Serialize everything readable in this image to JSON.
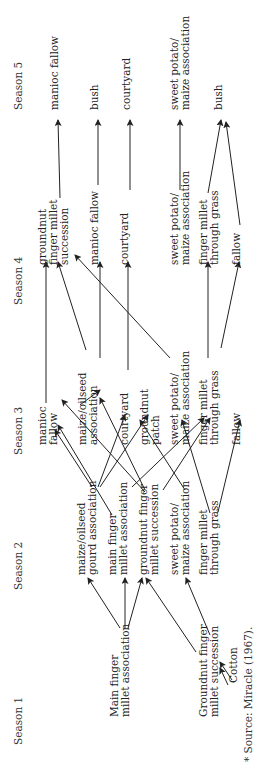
{
  "seasons": [
    {
      "label": "Season 1",
      "x": 22,
      "y": 745
    },
    {
      "label": "Season 2",
      "x": 22,
      "y": 590
    },
    {
      "label": "Season 3",
      "x": 22,
      "y": 455
    },
    {
      "label": "Season 4",
      "x": 22,
      "y": 305
    },
    {
      "label": "Season 5",
      "x": 22,
      "y": 110
    }
  ],
  "nodes": [
    {
      "id": "s1_main",
      "lines": [
        "Main finger",
        "millet association"
      ],
      "x": 118,
      "y": 717
    },
    {
      "id": "s1_gnut",
      "lines": [
        "Groundnut finger",
        "millet succession"
      ],
      "x": 207,
      "y": 717
    },
    {
      "id": "s1_cotton",
      "lines": [
        "Cotton"
      ],
      "x": 237,
      "y": 683
    },
    {
      "id": "s2_maize_gourd",
      "lines": [
        "maize/oilseed",
        "gourd association"
      ],
      "x": 85,
      "y": 575
    },
    {
      "id": "s2_main",
      "lines": [
        "main finger",
        "millet association"
      ],
      "x": 116,
      "y": 575
    },
    {
      "id": "s2_gnut",
      "lines": [
        "groundnut finger",
        "millet succession"
      ],
      "x": 147,
      "y": 575
    },
    {
      "id": "s2_sweet",
      "lines": [
        "sweet potato/",
        "maize association"
      ],
      "x": 178,
      "y": 575
    },
    {
      "id": "s2_fm_grass",
      "lines": [
        "finger millet",
        "through grass"
      ],
      "x": 207,
      "y": 575
    },
    {
      "id": "s3_manioc",
      "lines": [
        "manioc",
        "fallow"
      ],
      "x": 46,
      "y": 445
    },
    {
      "id": "s3_maize",
      "lines": [
        "maize/oilseed",
        "association"
      ],
      "x": 86,
      "y": 445
    },
    {
      "id": "s3_courtyard",
      "lines": [
        "courtyard"
      ],
      "x": 128,
      "y": 445
    },
    {
      "id": "s3_gnut_patch",
      "lines": [
        "groundnut",
        "patch"
      ],
      "x": 148,
      "y": 445
    },
    {
      "id": "s3_sweet",
      "lines": [
        "sweet potato/",
        "maize association"
      ],
      "x": 178,
      "y": 445
    },
    {
      "id": "s3_fm_grass",
      "lines": [
        "finger millet",
        "through grass"
      ],
      "x": 207,
      "y": 445
    },
    {
      "id": "s3_fallow",
      "lines": [
        "fallow"
      ],
      "x": 240,
      "y": 445
    },
    {
      "id": "s4_gnut_fm",
      "lines": [
        "groundnut",
        "finger millet",
        "succession"
      ],
      "x": 46,
      "y": 265
    },
    {
      "id": "s4_manioc",
      "lines": [
        "manioc fallow"
      ],
      "x": 98,
      "y": 265
    },
    {
      "id": "s4_courtyard",
      "lines": [
        "courtyard"
      ],
      "x": 128,
      "y": 265
    },
    {
      "id": "s4_sweet",
      "lines": [
        "sweet potato/",
        "maize association"
      ],
      "x": 178,
      "y": 265
    },
    {
      "id": "s4_fm_grass",
      "lines": [
        "finger millet",
        "through grass"
      ],
      "x": 207,
      "y": 265
    },
    {
      "id": "s4_fallow",
      "lines": [
        "fallow"
      ],
      "x": 240,
      "y": 265
    },
    {
      "id": "s5_manioc",
      "lines": [
        "manioc fallow"
      ],
      "x": 58,
      "y": 110
    },
    {
      "id": "s5_bush_a",
      "lines": [
        "bush"
      ],
      "x": 98,
      "y": 110
    },
    {
      "id": "s5_courtyard",
      "lines": [
        "courtyard"
      ],
      "x": 130,
      "y": 110
    },
    {
      "id": "s5_sweet",
      "lines": [
        "sweet potato/",
        "maize association"
      ],
      "x": 178,
      "y": 110
    },
    {
      "id": "s5_bush_b",
      "lines": [
        "bush"
      ],
      "x": 222,
      "y": 110
    }
  ],
  "edges": [
    {
      "from": "s1_main",
      "x1": 120,
      "y1": 628,
      "x2": 88,
      "y2": 578
    },
    {
      "from": "s1_main",
      "x1": 125,
      "y1": 628,
      "x2": 125,
      "y2": 578
    },
    {
      "from": "s1_main",
      "x1": 128,
      "y1": 628,
      "x2": 142,
      "y2": 578
    },
    {
      "from": "s1_gnut",
      "x1": 196,
      "y1": 652,
      "x2": 146,
      "y2": 578
    },
    {
      "from": "s1_gnut",
      "x1": 210,
      "y1": 635,
      "x2": 186,
      "y2": 578
    },
    {
      "from": "s1_cotton",
      "x1": 232,
      "y1": 680,
      "x2": 220,
      "y2": 662
    },
    {
      "from": "s1_cotton",
      "x1": 228,
      "y1": 685,
      "x2": 220,
      "y2": 668
    },
    {
      "from": "s2_maize_gourd",
      "x1": 98,
      "y1": 487,
      "x2": 125,
      "y2": 415
    },
    {
      "from": "s2_maize_gourd",
      "x1": 100,
      "y1": 487,
      "x2": 148,
      "y2": 415
    },
    {
      "from": "s2_maize_gourd",
      "x1": 92,
      "y1": 487,
      "x2": 55,
      "y2": 430
    },
    {
      "from": "s2_main",
      "x1": 112,
      "y1": 515,
      "x2": 58,
      "y2": 425
    },
    {
      "from": "s2_main",
      "x1": 132,
      "y1": 487,
      "x2": 204,
      "y2": 418
    },
    {
      "from": "s2_gnut",
      "x1": 145,
      "y1": 490,
      "x2": 100,
      "y2": 398
    },
    {
      "from": "s2_gnut",
      "x1": 145,
      "y1": 492,
      "x2": 62,
      "y2": 400
    },
    {
      "from": "s2_gnut",
      "x1": 163,
      "y1": 490,
      "x2": 210,
      "y2": 418
    },
    {
      "from": "s2_sweet",
      "x1": 185,
      "y1": 490,
      "x2": 140,
      "y2": 420
    },
    {
      "from": "s2_fm_grass",
      "x1": 210,
      "y1": 513,
      "x2": 182,
      "y2": 420
    },
    {
      "from": "s2_fm_grass",
      "x1": 218,
      "y1": 512,
      "x2": 240,
      "y2": 420
    },
    {
      "from": "s3_manioc",
      "x1": 46,
      "y1": 403,
      "x2": 46,
      "y2": 262
    },
    {
      "from": "s3_maize",
      "x1": 86,
      "y1": 350,
      "x2": 58,
      "y2": 262
    },
    {
      "from": "s3_maize",
      "x1": 100,
      "y1": 358,
      "x2": 100,
      "y2": 262
    },
    {
      "from": "s3_courtyard",
      "x1": 80,
      "y1": 405,
      "x2": 100,
      "y2": 390
    },
    {
      "from": "s3_courtyard",
      "x1": 128,
      "y1": 370,
      "x2": 128,
      "y2": 262
    },
    {
      "from": "s3_sweet",
      "x1": 170,
      "y1": 358,
      "x2": 75,
      "y2": 255
    },
    {
      "from": "s3_fm_grass",
      "x1": 208,
      "y1": 358,
      "x2": 208,
      "y2": 262
    },
    {
      "from": "s3_fm_grass",
      "x1": 221,
      "y1": 348,
      "x2": 239,
      "y2": 262
    },
    {
      "from": "s4_gnut_fm",
      "x1": 60,
      "y1": 198,
      "x2": 58,
      "y2": 120
    },
    {
      "from": "s4_manioc",
      "x1": 98,
      "y1": 185,
      "x2": 98,
      "y2": 120
    },
    {
      "from": "s4_courtyard",
      "x1": 130,
      "y1": 190,
      "x2": 130,
      "y2": 120
    },
    {
      "from": "s4_sweet",
      "x1": 180,
      "y1": 190,
      "x2": 180,
      "y2": 120
    },
    {
      "from": "s4_fm_grass",
      "x1": 208,
      "y1": 193,
      "x2": 221,
      "y2": 120
    },
    {
      "from": "s4_fallow",
      "x1": 240,
      "y1": 225,
      "x2": 226,
      "y2": 122
    }
  ],
  "source_note": "* Source:  Miracle (1967)."
}
